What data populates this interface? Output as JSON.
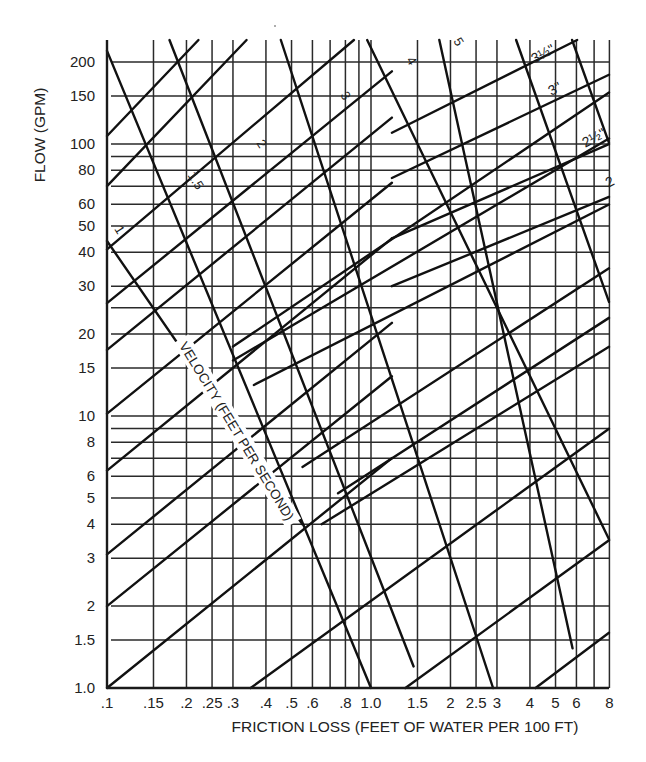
{
  "chart_data": {
    "type": "line",
    "title": "",
    "xlabel": "FRICTION LOSS (FEET OF WATER PER 100 FT)",
    "ylabel": "FLOW (GPM)",
    "xscale": "log",
    "yscale": "log",
    "xlim": [
      0.1,
      8
    ],
    "ylim": [
      1.0,
      250
    ],
    "grid": true,
    "legend": "none",
    "x_tick_labels": [
      ".1",
      ".15",
      ".2",
      ".25",
      ".3",
      ".4",
      ".5",
      ".6",
      ".8",
      "1.0",
      "1.5",
      "2",
      "2.5",
      "3",
      "4",
      "5",
      "6",
      "8"
    ],
    "x_ticks": [
      0.1,
      0.15,
      0.2,
      0.25,
      0.3,
      0.4,
      0.5,
      0.6,
      0.8,
      1.0,
      1.5,
      2,
      2.5,
      3,
      4,
      5,
      6,
      8
    ],
    "x_gridlines": [
      0.1,
      0.15,
      0.2,
      0.25,
      0.3,
      0.4,
      0.5,
      0.6,
      0.7,
      0.8,
      0.9,
      1.0,
      1.5,
      2,
      2.5,
      3,
      4,
      5,
      6,
      7,
      8
    ],
    "y_tick_labels": [
      "1.0",
      "1.5",
      "2",
      "3",
      "4",
      "5",
      "6",
      "8",
      "10",
      "15",
      "20",
      "30",
      "40",
      "50",
      "60",
      "80",
      "100",
      "150",
      "200"
    ],
    "y_ticks": [
      1,
      1.5,
      2,
      3,
      4,
      5,
      6,
      8,
      10,
      15,
      20,
      30,
      40,
      50,
      60,
      80,
      100,
      150,
      200
    ],
    "y_gridlines": [
      1.5,
      2,
      3,
      4,
      5,
      6,
      7,
      8,
      9,
      10,
      15,
      20,
      25,
      30,
      40,
      50,
      60,
      70,
      80,
      90,
      100,
      150,
      200
    ],
    "pipe_size_series": [
      {
        "name": "pipe-a",
        "points": [
          [
            0.1,
            1.0
          ],
          [
            1.2,
            7.0
          ]
        ]
      },
      {
        "name": "pipe-b",
        "points": [
          [
            0.1,
            2.0
          ],
          [
            1.2,
            14.0
          ]
        ]
      },
      {
        "name": "pipe-c",
        "points": [
          [
            0.1,
            3.1
          ],
          [
            1.2,
            22.0
          ]
        ]
      },
      {
        "name": "pipe-d",
        "points": [
          [
            0.1,
            6.3
          ],
          [
            1.2,
            45.0
          ]
        ]
      },
      {
        "name": "pipe-e",
        "points": [
          [
            0.1,
            10.2
          ],
          [
            1.2,
            72.0
          ]
        ]
      },
      {
        "name": "pipe-f",
        "points": [
          [
            0.1,
            17.5
          ],
          [
            1.2,
            125.0
          ]
        ]
      },
      {
        "name": "pipe-g",
        "points": [
          [
            0.1,
            26.0
          ],
          [
            1.2,
            185.0
          ]
        ]
      },
      {
        "name": "pipe-h",
        "points": [
          [
            0.1,
            41.0
          ],
          [
            0.9,
            250.0
          ]
        ]
      },
      {
        "name": "pipe-i",
        "points": [
          [
            0.1,
            70.0
          ],
          [
            0.35,
            250.0
          ]
        ]
      },
      {
        "name": "pipe-j",
        "points": [
          [
            0.1,
            107.0
          ],
          [
            0.23,
            250.0
          ]
        ]
      },
      {
        "name": "pipe-k",
        "points": [
          [
            0.35,
            1.0
          ],
          [
            8.0,
            9.0
          ]
        ]
      },
      {
        "name": "pipe-l",
        "points": [
          [
            1.35,
            1.0
          ],
          [
            8.0,
            3.5
          ]
        ]
      },
      {
        "name": "pipe-m",
        "points": [
          [
            4.2,
            1.0
          ],
          [
            8.0,
            1.6
          ]
        ]
      },
      {
        "name": "pipe-n",
        "points": [
          [
            0.3,
            16.0
          ],
          [
            8.0,
            105.0
          ]
        ]
      },
      {
        "name": "pipe-o",
        "points": [
          [
            0.36,
            13.0
          ],
          [
            8.0,
            60.0
          ]
        ]
      },
      {
        "name": "pipe-p",
        "points": [
          [
            0.65,
            4.0
          ],
          [
            8.0,
            18.0
          ]
        ]
      },
      {
        "name": "pipe-q",
        "points": [
          [
            0.75,
            5.2
          ],
          [
            8.0,
            23.0
          ]
        ]
      },
      {
        "name": "pipe-r",
        "points": [
          [
            0.55,
            6.5
          ],
          [
            8.0,
            35.0
          ]
        ]
      },
      {
        "name": "pipe-s",
        "points": [
          [
            0.3,
            18.0
          ],
          [
            8.0,
            155.0
          ]
        ]
      },
      {
        "name": "2\"",
        "points": [
          [
            1.2,
            30.0
          ],
          [
            8.0,
            64.0
          ]
        ]
      },
      {
        "name": "2½\"",
        "points": [
          [
            1.2,
            45.0
          ],
          [
            8.0,
            100.0
          ]
        ]
      },
      {
        "name": "3\"",
        "points": [
          [
            1.2,
            75.0
          ],
          [
            8.0,
            180.0
          ]
        ]
      },
      {
        "name": "3½\"",
        "points": [
          [
            1.2,
            110.0
          ],
          [
            6.5,
            250.0
          ]
        ]
      }
    ],
    "velocity_series": [
      {
        "name": "1",
        "points": [
          [
            0.1,
            44.0
          ],
          [
            0.55,
            4.0
          ]
        ]
      },
      {
        "name": "1.5",
        "points": [
          [
            0.1,
            220.0
          ],
          [
            1.0,
            1.0
          ]
        ]
      },
      {
        "name": "2",
        "points": [
          [
            0.17,
            250.0
          ],
          [
            1.45,
            1.2
          ]
        ]
      },
      {
        "name": "3",
        "points": [
          [
            0.45,
            250.0
          ],
          [
            2.9,
            1.0
          ]
        ]
      },
      {
        "name": "4",
        "points": [
          [
            0.95,
            250.0
          ],
          [
            8.0,
            3.5
          ]
        ]
      },
      {
        "name": "5",
        "points": [
          [
            1.8,
            250.0
          ],
          [
            5.8,
            1.4
          ]
        ]
      },
      {
        "name": "6",
        "points": [
          [
            3.5,
            250.0
          ],
          [
            8.0,
            26.0
          ]
        ]
      },
      {
        "name": "extra",
        "points": [
          [
            5.7,
            250.0
          ],
          [
            8.0,
            100.0
          ]
        ]
      }
    ],
    "annotations": [
      {
        "text": "VELOCITY (FEET PER SECOND)",
        "along": "velocity line 1.5"
      },
      {
        "text": "1",
        "series": "velocity"
      },
      {
        "text": "1.5",
        "series": "velocity"
      },
      {
        "text": "2",
        "series": "velocity"
      },
      {
        "text": "3",
        "series": "velocity"
      },
      {
        "text": "4",
        "series": "velocity"
      },
      {
        "text": "5",
        "series": "velocity"
      },
      {
        "text": "2",
        "series": "velocity"
      },
      {
        "text": "3½\"",
        "series": "pipe size"
      },
      {
        "text": "3\"",
        "series": "pipe size"
      },
      {
        "text": "2½\"",
        "series": "pipe size"
      },
      {
        "text": "2",
        "series": "pipe size"
      }
    ]
  },
  "labels": {
    "y_axis_title": "FLOW (GPM)",
    "x_axis_title": "FRICTION LOSS (FEET OF WATER PER 100 FT)",
    "velocity_title": "VELOCITY (FEET PER SECOND)",
    "vel_1": "1",
    "vel_1_5": "1.5",
    "vel_2": "2",
    "vel_3": "3",
    "vel_4": "4",
    "vel_5": "5",
    "pipe_3_5": "3½\"",
    "pipe_3": "3\"",
    "pipe_2_5": "2½\"",
    "pipe_2": "2"
  },
  "colors": {
    "ink": "#1a1a1a",
    "grid": "#2a2a2a",
    "background": "#ffffff"
  }
}
